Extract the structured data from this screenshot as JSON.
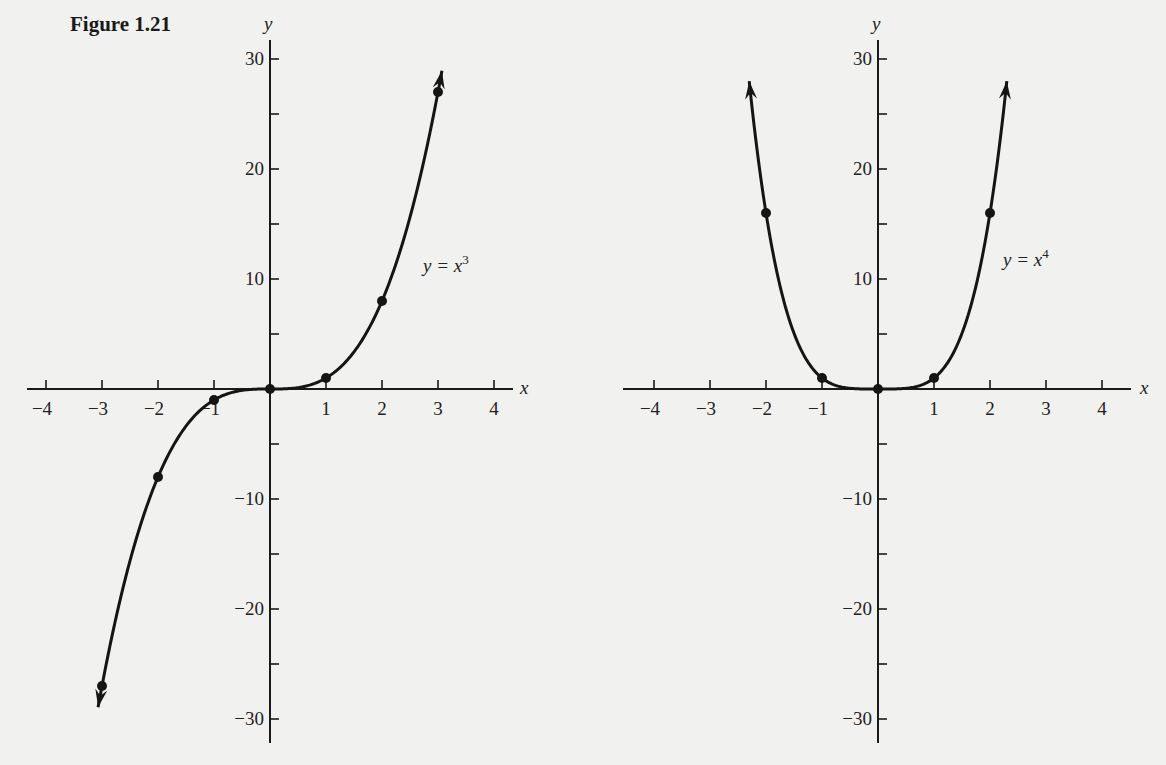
{
  "figure_title": "Figure 1.21",
  "chart_data": [
    {
      "type": "line",
      "function": "y = x^3",
      "label_main": "y = x",
      "label_exp": "3",
      "xlabel": "x",
      "ylabel": "y",
      "xlim": [
        -4,
        4
      ],
      "ylim": [
        -30,
        30
      ],
      "x_ticks": [
        -4,
        -3,
        -2,
        -1,
        1,
        2,
        3,
        4
      ],
      "x_tick_labels": [
        "−4",
        "−3",
        "−2",
        "−1",
        "1",
        "2",
        "3",
        "4"
      ],
      "y_ticks": [
        -30,
        -25,
        -20,
        -15,
        -10,
        -5,
        5,
        10,
        15,
        20,
        25,
        30
      ],
      "y_tick_labels": {
        "30": "30",
        "20": "20",
        "10": "10",
        "-10": "−10",
        "-20": "−20",
        "-30": "−30"
      },
      "points": [
        {
          "x": -3,
          "y": -27
        },
        {
          "x": -2,
          "y": -8
        },
        {
          "x": -1,
          "y": -1
        },
        {
          "x": 0,
          "y": 0
        },
        {
          "x": 1,
          "y": 1
        },
        {
          "x": 2,
          "y": 8
        },
        {
          "x": 3,
          "y": 27
        }
      ],
      "curve_x_range": [
        -3.07,
        3.07
      ],
      "arrows_at_ends": true,
      "grid": false
    },
    {
      "type": "line",
      "function": "y = x^4",
      "label_main": "y = x",
      "label_exp": "4",
      "xlabel": "x",
      "ylabel": "y",
      "xlim": [
        -4,
        4
      ],
      "ylim": [
        -30,
        30
      ],
      "x_ticks": [
        -4,
        -3,
        -2,
        -1,
        1,
        2,
        3,
        4
      ],
      "x_tick_labels": [
        "−4",
        "−3",
        "−2",
        "−1",
        "1",
        "2",
        "3",
        "4"
      ],
      "y_ticks": [
        -30,
        -25,
        -20,
        -15,
        -10,
        -5,
        5,
        10,
        15,
        20,
        25,
        30
      ],
      "y_tick_labels": {
        "30": "30",
        "20": "20",
        "10": "10",
        "-10": "−10",
        "-20": "−20",
        "-30": "−30"
      },
      "points": [
        {
          "x": -2,
          "y": 16
        },
        {
          "x": -1,
          "y": 1
        },
        {
          "x": 0,
          "y": 0
        },
        {
          "x": 1,
          "y": 1
        },
        {
          "x": 2,
          "y": 16
        }
      ],
      "curve_x_range": [
        -2.3,
        2.3
      ],
      "arrows_at_ends": true,
      "grid": false
    }
  ]
}
